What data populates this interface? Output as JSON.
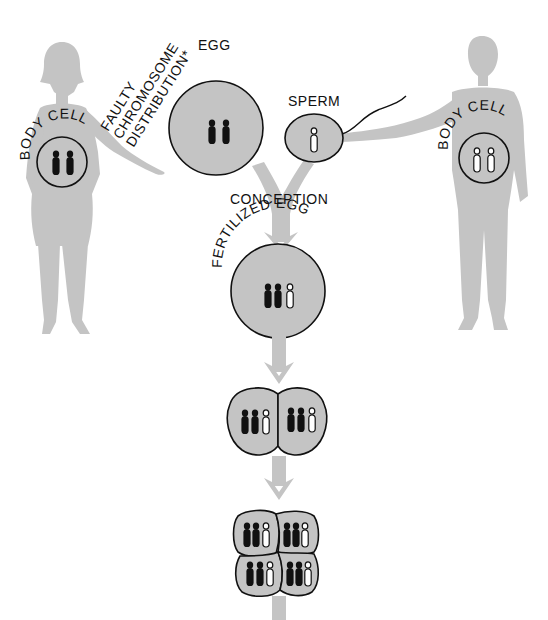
{
  "diagram": {
    "type": "biology-illustration",
    "colors": {
      "silhouette": "#c4c4c4",
      "cell_fill": "#c4c4c4",
      "outline": "#111111",
      "chromosome_maternal": "#111111",
      "chromosome_paternal": "#ffffff"
    }
  },
  "labels": {
    "faulty_line1": "FAULTY",
    "faulty_line2": "CHROMOSOME",
    "faulty_line3": "DISTRIBUTION*",
    "egg": "EGG",
    "sperm": "SPERM",
    "conception": "CONCEPTION",
    "fertilized_egg": "FERTILIZED EGG",
    "mother_body_cell": "BODY CELL",
    "father_body_cell": "BODY CELL"
  },
  "nodes": [
    {
      "id": "mother",
      "label": "female silhouette",
      "body_cell_chromosomes": {
        "dark": 2,
        "light": 0
      }
    },
    {
      "id": "father",
      "label": "male silhouette",
      "body_cell_chromosomes": {
        "dark": 0,
        "light": 2
      }
    },
    {
      "id": "egg",
      "label": "EGG",
      "chromosomes": {
        "dark": 2,
        "light": 0
      }
    },
    {
      "id": "sperm",
      "label": "SPERM",
      "chromosomes": {
        "dark": 0,
        "light": 1
      }
    },
    {
      "id": "fertilized_egg",
      "label": "FERTILIZED EGG",
      "chromosomes": {
        "dark": 2,
        "light": 1
      }
    },
    {
      "id": "two_cell",
      "cells": 2,
      "chromosomes_per_cell": {
        "dark": 2,
        "light": 1
      }
    },
    {
      "id": "four_cell",
      "cells": 4,
      "chromosomes_per_cell": {
        "dark": 2,
        "light": 1
      }
    }
  ],
  "edges": [
    {
      "from": "mother",
      "to": "egg",
      "label": "FAULTY CHROMOSOME DISTRIBUTION*"
    },
    {
      "from": "father",
      "to": "sperm"
    },
    {
      "from": "egg",
      "to": "fertilized_egg",
      "label": "CONCEPTION"
    },
    {
      "from": "sperm",
      "to": "fertilized_egg",
      "label": "CONCEPTION"
    },
    {
      "from": "fertilized_egg",
      "to": "two_cell"
    },
    {
      "from": "two_cell",
      "to": "four_cell"
    }
  ]
}
